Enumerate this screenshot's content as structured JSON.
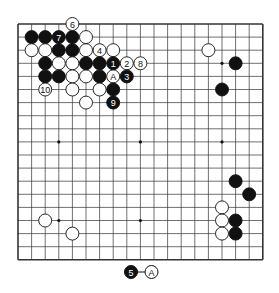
{
  "diagram": {
    "type": "go-board",
    "size": 19,
    "grid_origin": {
      "x": 18,
      "y": 24
    },
    "grid_spacing": {
      "x": 13.6,
      "y": 13.1
    },
    "colors": {
      "line": "#333333",
      "black": "#111111",
      "white": "#ffffff",
      "background": "#ffffff"
    },
    "star_points": [
      [
        3,
        3
      ],
      [
        9,
        3
      ],
      [
        15,
        3
      ],
      [
        3,
        9
      ],
      [
        9,
        9
      ],
      [
        15,
        9
      ],
      [
        3,
        15
      ],
      [
        9,
        15
      ],
      [
        15,
        15
      ]
    ],
    "stones": [
      {
        "color": "black",
        "col": 1,
        "row": 1,
        "label": ""
      },
      {
        "color": "black",
        "col": 2,
        "row": 1,
        "label": ""
      },
      {
        "color": "black",
        "col": 3,
        "row": 1,
        "label": "7"
      },
      {
        "color": "black",
        "col": 4,
        "row": 1,
        "label": ""
      },
      {
        "color": "white",
        "col": 5,
        "row": 1,
        "label": ""
      },
      {
        "color": "white",
        "col": 4,
        "row": 0,
        "label": "6"
      },
      {
        "color": "white",
        "col": 1,
        "row": 2,
        "label": ""
      },
      {
        "color": "white",
        "col": 2,
        "row": 2,
        "label": ""
      },
      {
        "color": "black",
        "col": 3,
        "row": 2,
        "label": ""
      },
      {
        "color": "black",
        "col": 4,
        "row": 2,
        "label": ""
      },
      {
        "color": "white",
        "col": 5,
        "row": 2,
        "label": ""
      },
      {
        "color": "white",
        "col": 6,
        "row": 2,
        "label": "4"
      },
      {
        "color": "white",
        "col": 7,
        "row": 2,
        "label": ""
      },
      {
        "color": "black",
        "col": 2,
        "row": 3,
        "label": ""
      },
      {
        "color": "white",
        "col": 3,
        "row": 3,
        "label": ""
      },
      {
        "color": "white",
        "col": 4,
        "row": 3,
        "label": ""
      },
      {
        "color": "black",
        "col": 5,
        "row": 3,
        "label": ""
      },
      {
        "color": "black",
        "col": 6,
        "row": 3,
        "label": ""
      },
      {
        "color": "black",
        "col": 7,
        "row": 3,
        "label": "1"
      },
      {
        "color": "white",
        "col": 8,
        "row": 3,
        "label": "2"
      },
      {
        "color": "white",
        "col": 9,
        "row": 3,
        "label": "8"
      },
      {
        "color": "black",
        "col": 2,
        "row": 4,
        "label": ""
      },
      {
        "color": "black",
        "col": 3,
        "row": 4,
        "label": ""
      },
      {
        "color": "white",
        "col": 4,
        "row": 4,
        "label": ""
      },
      {
        "color": "white",
        "col": 5,
        "row": 4,
        "label": ""
      },
      {
        "color": "black",
        "col": 6,
        "row": 4,
        "label": ""
      },
      {
        "color": "white",
        "col": 7,
        "row": 4,
        "label": "A"
      },
      {
        "color": "black",
        "col": 8,
        "row": 4,
        "label": "3"
      },
      {
        "color": "white",
        "col": 2,
        "row": 5,
        "label": "10"
      },
      {
        "color": "white",
        "col": 4,
        "row": 5,
        "label": ""
      },
      {
        "color": "white",
        "col": 6,
        "row": 5,
        "label": ""
      },
      {
        "color": "black",
        "col": 7,
        "row": 5,
        "label": ""
      },
      {
        "color": "white",
        "col": 5,
        "row": 6,
        "label": ""
      },
      {
        "color": "black",
        "col": 7,
        "row": 6,
        "label": "9"
      },
      {
        "color": "white",
        "col": 14,
        "row": 2,
        "label": ""
      },
      {
        "color": "black",
        "col": 16,
        "row": 3,
        "label": ""
      },
      {
        "color": "black",
        "col": 15,
        "row": 5,
        "label": ""
      },
      {
        "color": "black",
        "col": 16,
        "row": 12,
        "label": ""
      },
      {
        "color": "black",
        "col": 17,
        "row": 13,
        "label": ""
      },
      {
        "color": "white",
        "col": 15,
        "row": 14,
        "label": ""
      },
      {
        "color": "white",
        "col": 15,
        "row": 15,
        "label": ""
      },
      {
        "color": "black",
        "col": 16,
        "row": 15,
        "label": ""
      },
      {
        "color": "white",
        "col": 15,
        "row": 16,
        "label": ""
      },
      {
        "color": "black",
        "col": 16,
        "row": 16,
        "label": ""
      },
      {
        "color": "white",
        "col": 2,
        "row": 15,
        "label": ""
      },
      {
        "color": "white",
        "col": 4,
        "row": 16,
        "label": ""
      }
    ],
    "caption": {
      "left_stone": {
        "color": "black",
        "label": "5"
      },
      "connector": "—",
      "right_stone": {
        "color": "white",
        "label": "A"
      }
    }
  }
}
